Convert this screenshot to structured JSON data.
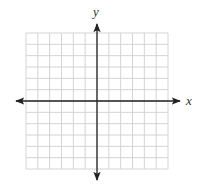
{
  "diagram": {
    "type": "coordinate-plane",
    "x_axis_label": "x",
    "y_axis_label": "y",
    "grid": {
      "columns": 12,
      "rows": 12,
      "left": 26,
      "top": 33,
      "width": 142,
      "height": 136,
      "line_color": "#d4d4d4"
    },
    "axes": {
      "origin_x": 97,
      "origin_y": 101,
      "x_min": 16,
      "x_max": 180,
      "y_min": 24,
      "y_max": 180,
      "color": "#222222"
    }
  }
}
